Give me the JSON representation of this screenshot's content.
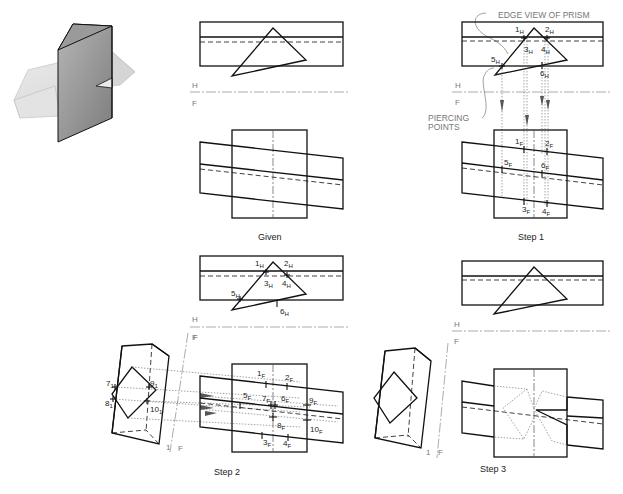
{
  "figure": {
    "panels": [
      {
        "id": "given",
        "caption": "Given"
      },
      {
        "id": "step1",
        "caption": "Step 1"
      },
      {
        "id": "step2",
        "caption": "Step 2"
      },
      {
        "id": "step3",
        "caption": "Step 3"
      }
    ],
    "fold_line_labels": {
      "top": "H",
      "bottom": "F",
      "aux_1": "1",
      "aux_f": "F"
    },
    "annotations": {
      "edge_view": "EDGE VIEW OF PRISM",
      "piercing_1": "PIERCING",
      "piercing_2": "POINTS"
    },
    "points": {
      "h": [
        "1",
        "2",
        "3",
        "4",
        "5",
        "6"
      ],
      "h_sub": "H",
      "f": [
        "1",
        "2",
        "3",
        "4",
        "5",
        "6",
        "7",
        "8",
        "9",
        "10"
      ],
      "f_sub": "F",
      "aux": [
        "7",
        "8",
        "9",
        "10"
      ],
      "aux_sub": "1"
    },
    "colors": {
      "line": "#111111",
      "hidden": "#111111",
      "projection": "#666666",
      "fold": "#888888",
      "shade_dark": "#8a8a8a",
      "shade_light": "#d9d9d9"
    }
  }
}
